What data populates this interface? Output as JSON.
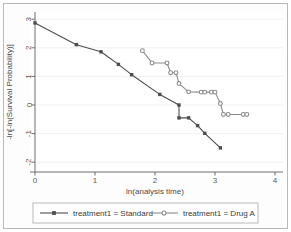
{
  "chart_data": {
    "type": "line",
    "title": "",
    "xlabel": "ln(analysis time)",
    "ylabel": "-ln[-ln(Survival Probability)]",
    "xlim": [
      -0.18,
      4.25
    ],
    "ylim": [
      -2.25,
      3.25
    ],
    "xticks": [
      0,
      1,
      2,
      3,
      4
    ],
    "xticklabels": [
      "0",
      "1",
      "2",
      "3",
      "4"
    ],
    "yticks": [
      -2,
      -1,
      0,
      1,
      2,
      3
    ],
    "yticklabels": [
      "-2",
      "-1",
      "0",
      "1",
      "2",
      "3"
    ],
    "grid": "horizontal",
    "legend_position": "bottom",
    "series": [
      {
        "name": "treatment1 = Standard",
        "color": "#4d4d4d",
        "marker": "square",
        "points": [
          [
            0.0,
            2.87
          ],
          [
            0.69,
            2.11
          ],
          [
            1.1,
            1.86
          ],
          [
            1.39,
            1.42
          ],
          [
            1.61,
            1.06
          ],
          [
            2.08,
            0.37
          ],
          [
            2.4,
            0.0
          ],
          [
            2.4,
            -0.45
          ],
          [
            2.56,
            -0.45
          ],
          [
            2.71,
            -0.72
          ],
          [
            2.83,
            -0.99
          ],
          [
            3.09,
            -1.5
          ]
        ]
      },
      {
        "name": "treatment1 = Drug A",
        "color": "#8c8c8c",
        "marker": "circle",
        "points": [
          [
            1.79,
            1.9
          ],
          [
            1.95,
            1.47
          ],
          [
            2.2,
            1.47
          ],
          [
            2.26,
            1.13
          ],
          [
            2.35,
            1.13
          ],
          [
            2.4,
            0.75
          ],
          [
            2.56,
            0.46
          ],
          [
            2.77,
            0.45
          ],
          [
            2.83,
            0.45
          ],
          [
            2.94,
            0.45
          ],
          [
            3.0,
            0.45
          ],
          [
            3.09,
            0.05
          ],
          [
            3.14,
            -0.33
          ],
          [
            3.22,
            -0.33
          ],
          [
            3.47,
            -0.33
          ],
          [
            3.53,
            -0.33
          ]
        ]
      }
    ]
  },
  "legend": {
    "items": [
      {
        "label": "treatment1 = Standard",
        "color": "#4d4d4d",
        "marker": "square"
      },
      {
        "label": "treatment1 = Drug A",
        "color": "#8c8c8c",
        "marker": "circle"
      }
    ]
  },
  "colors": {
    "standard": "#4d4d4d",
    "drug_a": "#8c8c8c",
    "axis": "#6f6f6f",
    "grid": "#eeeeee",
    "border": "#b9b9b9",
    "background": "#ffffff"
  }
}
